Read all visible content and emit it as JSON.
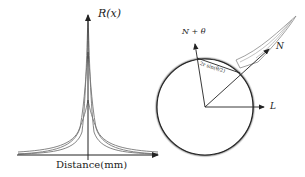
{
  "left_panel": {
    "y_axis_label": "R(x)",
    "x_axis_label": "Distance(mm)",
    "curves": [
      "narrow-tall-peak",
      "medium-peak",
      "wide-low-peak"
    ]
  },
  "right_panel": {
    "label_n_theta": "N + θ",
    "label_n": "N",
    "label_l": "L",
    "chord_label": "2r sin(θ/2)"
  },
  "colors": {
    "ink": "#222222",
    "curve": "#555555",
    "shadow": "#666666"
  }
}
